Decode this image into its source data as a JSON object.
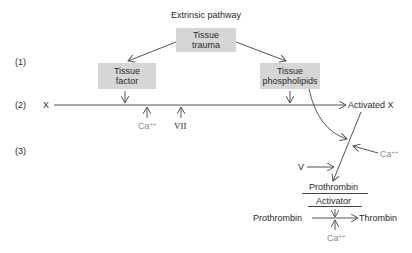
{
  "title": "Extrinsic pathway",
  "steps": [
    "(1)",
    "(2)",
    "(3)"
  ],
  "boxes": {
    "trauma": {
      "line1": "Tissue",
      "line2": "trauma"
    },
    "factor": {
      "line1": "Tissue",
      "line2": "factor"
    },
    "phospholipids": {
      "line1": "Tissue",
      "line2": "phospholipids"
    }
  },
  "nodes": {
    "x": "X",
    "activated_x": "Activated X",
    "ca_base": "Ca",
    "ca_sup": "++",
    "vii": "VII",
    "v": "V",
    "prothrombin_activator_line1": "Prothrombin",
    "prothrombin_activator_line2": "Activator",
    "prothrombin": "Prothrombin",
    "thrombin": "Thrombin"
  },
  "colors": {
    "box_fill": "#d6d6d6",
    "line": "#555555",
    "cofactor_text": "#8a8a8a"
  }
}
